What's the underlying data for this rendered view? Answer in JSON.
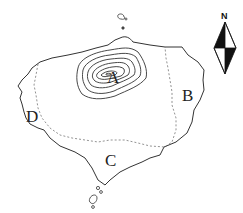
{
  "map": {
    "labels": {
      "a": "A",
      "b": "B",
      "c": "C",
      "d": "D"
    },
    "compass": {
      "north_label": "N",
      "icon": "north-arrow-icon"
    },
    "colors": {
      "coastline": "#333333",
      "contour": "#333333",
      "boundary_dashed": "#777777",
      "background": "#ffffff"
    },
    "features": {
      "contour_lines": 7,
      "dashed_boundary": true,
      "small_islets_north": 2,
      "small_islets_south": 3
    }
  }
}
